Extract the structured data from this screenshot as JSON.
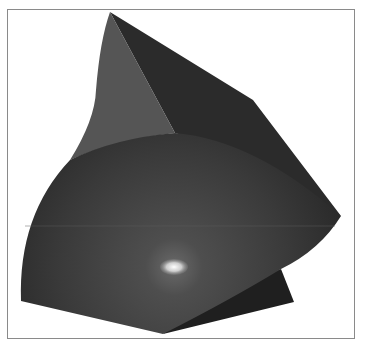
{
  "figure": {
    "colors": {
      "frame": "#8a8a8a",
      "background": "#ffffff",
      "left_face": "#555555",
      "right_face": "#2b2b2b",
      "sphere_dark": "#2e2e2e",
      "sphere_light": "#4a4a4a",
      "bottom_wedge": "#1f1f1f",
      "highlight": "#ffffff"
    },
    "points": {
      "top_tip": [
        110,
        12
      ],
      "right_upper_corner": [
        253,
        100
      ],
      "right_tip": [
        341,
        216
      ],
      "left_face_bottom": [
        70,
        160
      ],
      "ridge_meet": [
        175,
        133
      ],
      "left_sphere_bottom": [
        21,
        301
      ],
      "bottom_point": [
        163,
        334
      ],
      "wedge_top": [
        281,
        269
      ],
      "wedge_right": [
        294,
        302
      ],
      "highlight_center": [
        174,
        267
      ]
    }
  }
}
